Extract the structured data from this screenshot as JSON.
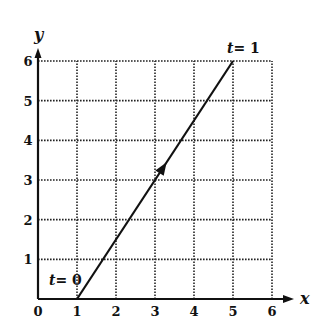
{
  "chart_data": {
    "type": "line",
    "title": "",
    "xlabel": "x",
    "ylabel": "y",
    "xlim": [
      0,
      6
    ],
    "ylim": [
      0,
      6
    ],
    "grid": true,
    "grid_style": "dotted",
    "x_ticks": [
      "0",
      "1",
      "2",
      "3",
      "4",
      "5",
      "6"
    ],
    "y_ticks": [
      "1",
      "2",
      "3",
      "4",
      "5",
      "6"
    ],
    "series": [
      {
        "name": "parametric path",
        "x": [
          1,
          5
        ],
        "y": [
          0,
          6
        ],
        "direction_arrow_at": [
          3.2,
          3.3
        ]
      }
    ],
    "annotations": [
      {
        "text": "t = 0",
        "t_symbol": "t",
        "eq": "= 0",
        "at": [
          1,
          0
        ]
      },
      {
        "text": "t = 1",
        "t_symbol": "t",
        "eq": "= 1",
        "at": [
          5,
          6
        ]
      }
    ]
  },
  "colors": {
    "ink": "#111111",
    "background": "#ffffff"
  }
}
